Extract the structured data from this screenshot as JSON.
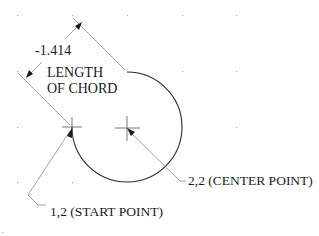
{
  "diagram": {
    "dimension": {
      "value": "-1.414",
      "caption_line1": "LENGTH",
      "caption_line2": "OF CHORD"
    },
    "center_point": {
      "label": "2,2 (CENTER POINT)",
      "x": 2,
      "y": 2
    },
    "start_point": {
      "label": "1,2 (START POINT)",
      "x": 1,
      "y": 2
    },
    "colors": {
      "ink": "#1a1a1a",
      "leader": "#8a8a8a",
      "grid": "#b0b0b0"
    }
  }
}
